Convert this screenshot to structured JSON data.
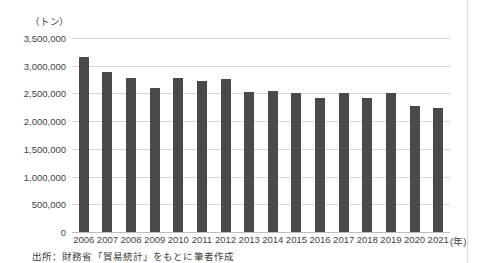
{
  "figure": {
    "unit_label": "（トン）",
    "x_unit_label": "(年)",
    "source_note": "出所：財務省「貿易統計」をもとに筆者作成"
  },
  "chart_data": {
    "type": "bar",
    "title": "",
    "xlabel": "(年)",
    "ylabel": "（トン）",
    "ylim": [
      0,
      3500000
    ],
    "ytick_step": 500000,
    "grid": true,
    "legend": false,
    "bar_color": "#4a4a4a",
    "categories": [
      "2006",
      "2007",
      "2008",
      "2009",
      "2010",
      "2011",
      "2012",
      "2013",
      "2014",
      "2015",
      "2016",
      "2017",
      "2018",
      "2019",
      "2020",
      "2021"
    ],
    "values": [
      3160000,
      2890000,
      2780000,
      2590000,
      2780000,
      2730000,
      2760000,
      2520000,
      2550000,
      2500000,
      2410000,
      2500000,
      2420000,
      2500000,
      2280000,
      2230000
    ],
    "ytick_labels": [
      "0",
      "500,000",
      "1,000,000",
      "1,500,000",
      "2,000,000",
      "2,500,000",
      "3,000,000",
      "3,500,000"
    ]
  }
}
